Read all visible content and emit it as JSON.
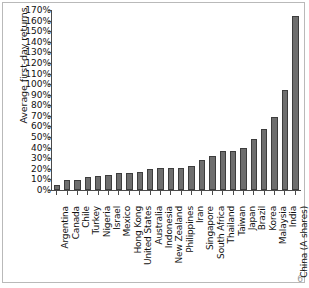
{
  "chart_data": {
    "type": "bar",
    "title": "",
    "xlabel": "",
    "ylabel": "Average first-day returns",
    "ylim": [
      0,
      170
    ],
    "ytick_step": 10,
    "ytick_labels": [
      "0%",
      "10%",
      "20%",
      "30%",
      "40%",
      "50%",
      "60%",
      "70%",
      "80%",
      "90%",
      "100%",
      "110%",
      "120%",
      "130%",
      "140%",
      "150%",
      "160%",
      "170%"
    ],
    "grid": false,
    "legend": null,
    "bar_color": "#6e6e6e",
    "bar_edge_color": "#3d3d3d",
    "categories": [
      "Argentina",
      "Canada",
      "Chile",
      "Turkey",
      "Nigeria",
      "Israel",
      "Mexico",
      "Hong Kong",
      "United States",
      "Australia",
      "Indonesia",
      "New Zealand",
      "Philippines",
      "Iran",
      "Singapore",
      "South Africa",
      "Thailand",
      "Taiwan",
      "Japan",
      "Brazil",
      "Korea",
      "Malaysia",
      "India",
      "China (A shares)"
    ],
    "values": [
      5,
      9,
      9.5,
      12.5,
      13.5,
      14.5,
      16,
      16,
      17,
      20,
      20.5,
      20.5,
      21,
      22.5,
      28.5,
      32,
      36.5,
      37,
      40,
      48.5,
      58,
      69,
      94.5,
      164
    ],
    "value_unit": "%"
  },
  "page": {
    "number": "6"
  }
}
